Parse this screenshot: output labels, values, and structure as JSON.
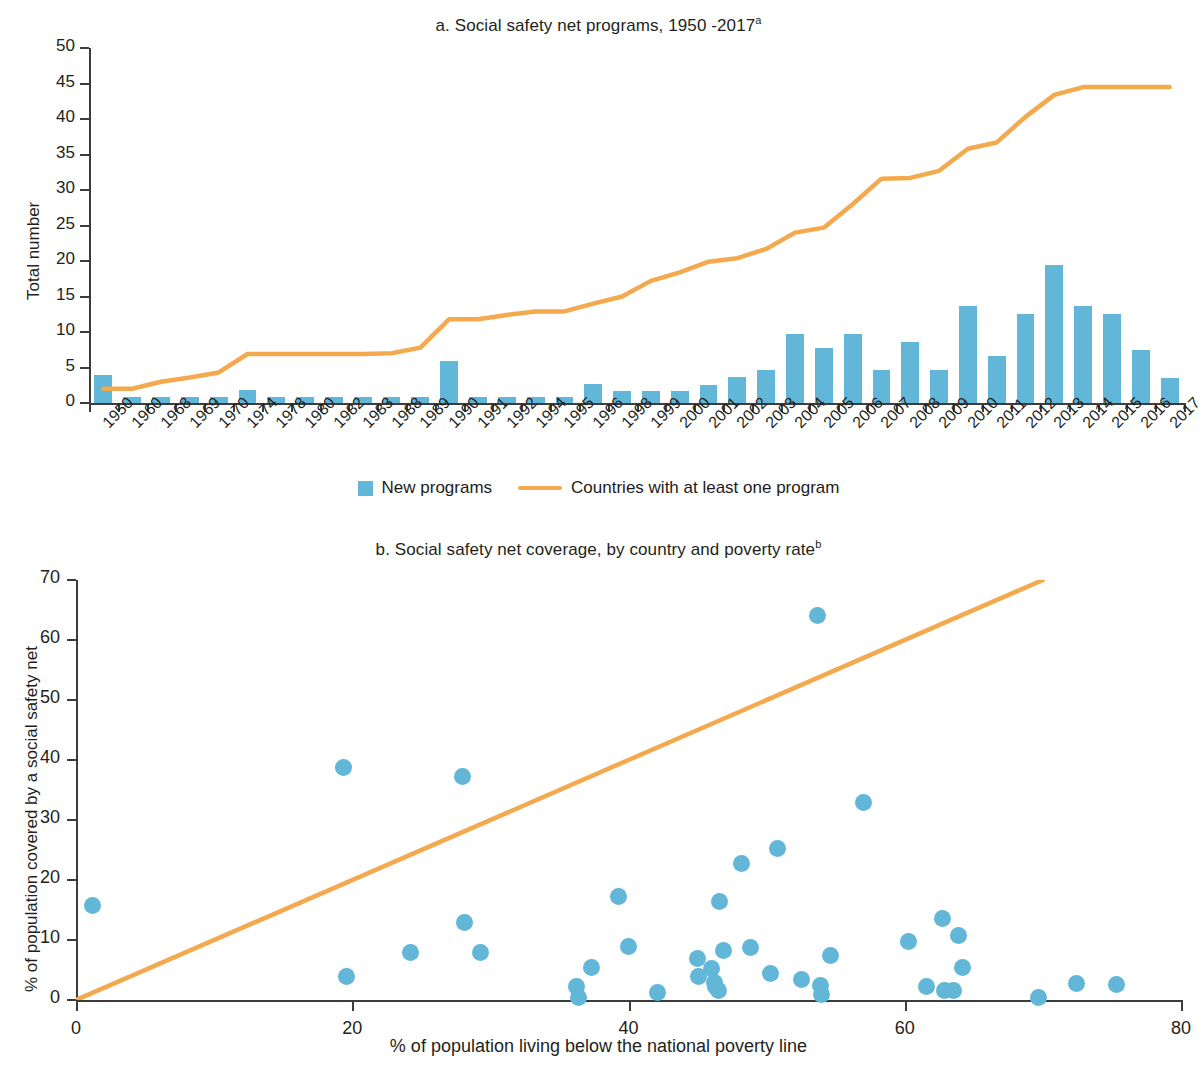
{
  "colors": {
    "bar": "#62b7d8",
    "line": "#f5a94e",
    "axis": "#3c3c3c",
    "text": "#231f20"
  },
  "panel_a": {
    "title": "a. Social safety net programs, 1950 -2017",
    "title_superscript": "a",
    "y_axis_label": "Total number",
    "y_ticks": [
      "0",
      "5",
      "10",
      "15",
      "20",
      "25",
      "30",
      "35",
      "40",
      "45",
      "50"
    ],
    "legend": [
      {
        "label": "New programs",
        "marker": "square-swatch"
      },
      {
        "label": "Countries with at least one program",
        "marker": "line-swatch"
      }
    ]
  },
  "panel_b": {
    "title": "b. Social safety net coverage, by country and poverty rate",
    "title_superscript": "b",
    "y_axis_label": "% of population covered by a social safety net",
    "x_axis_label": "% of population living below the national poverty line",
    "y_ticks": [
      "0",
      "10",
      "20",
      "30",
      "40",
      "50",
      "60",
      "70"
    ],
    "x_ticks": [
      "0",
      "20",
      "40",
      "60",
      "80"
    ]
  },
  "chart_data": [
    {
      "type": "bar",
      "id": "panel-a",
      "title": "a. Social safety net programs, 1950 -2017",
      "xlabel": "",
      "ylabel": "Total number",
      "ylim": [
        0,
        50
      ],
      "ytick_step": 5,
      "grid": false,
      "legend_position": "bottom",
      "categories": [
        "1950",
        "1960",
        "1968",
        "1969",
        "1970",
        "1974",
        "1978",
        "1980",
        "1982",
        "1983",
        "1988",
        "1989",
        "1990",
        "1991",
        "1992",
        "1994",
        "1995",
        "1996",
        "1998",
        "1999",
        "2000",
        "2001",
        "2002",
        "2003",
        "2004",
        "2005",
        "2006",
        "2007",
        "2008",
        "2009",
        "2010",
        "2011",
        "2012",
        "2013",
        "2014",
        "2015",
        "2016",
        "2017"
      ],
      "series": [
        {
          "name": "New programs",
          "kind": "bar",
          "color": "#62b7d8",
          "values": [
            4.0,
            0.8,
            0.8,
            0.8,
            0.8,
            1.9,
            0.8,
            0.8,
            0.8,
            0.8,
            0.8,
            0.8,
            5.9,
            0.8,
            0.8,
            0.8,
            0.8,
            2.7,
            1.7,
            1.7,
            1.7,
            2.6,
            3.7,
            4.7,
            9.7,
            7.7,
            9.7,
            4.7,
            8.6,
            4.7,
            13.7,
            6.6,
            12.5,
            19.5,
            13.6,
            12.5,
            7.5,
            3.5
          ]
        },
        {
          "name": "Countries with at least one program",
          "kind": "line",
          "color": "#f5a94e",
          "values": [
            2.0,
            2.0,
            3.0,
            3.6,
            4.3,
            6.9,
            6.9,
            6.9,
            6.9,
            6.9,
            7.0,
            7.8,
            11.8,
            11.8,
            12.4,
            12.9,
            12.9,
            14.0,
            15.0,
            17.2,
            18.4,
            19.9,
            20.4,
            21.7,
            24.0,
            24.7,
            28.0,
            31.6,
            31.7,
            32.7,
            35.8,
            36.7,
            40.3,
            43.4,
            44.5,
            44.5,
            44.5,
            44.5
          ]
        }
      ]
    },
    {
      "type": "scatter",
      "id": "panel-b",
      "title": "b. Social safety net coverage, by country and poverty rate",
      "xlabel": "% of population living below the national poverty line",
      "ylabel": "% of population covered by a social safety net",
      "xlim": [
        0,
        80
      ],
      "ylim": [
        0,
        70
      ],
      "xtick_step": 20,
      "ytick_step": 10,
      "grid": false,
      "legend_position": "none",
      "points": [
        {
          "x": 1.2,
          "y": 15.8
        },
        {
          "x": 19.4,
          "y": 38.8
        },
        {
          "x": 19.6,
          "y": 3.9
        },
        {
          "x": 24.2,
          "y": 7.9
        },
        {
          "x": 28.0,
          "y": 37.3
        },
        {
          "x": 28.1,
          "y": 13.0
        },
        {
          "x": 29.3,
          "y": 8.0
        },
        {
          "x": 36.2,
          "y": 2.3
        },
        {
          "x": 36.4,
          "y": 0.5
        },
        {
          "x": 37.3,
          "y": 5.5
        },
        {
          "x": 39.3,
          "y": 17.3
        },
        {
          "x": 40.0,
          "y": 9.0
        },
        {
          "x": 42.1,
          "y": 1.2
        },
        {
          "x": 45.0,
          "y": 7.0
        },
        {
          "x": 45.1,
          "y": 4.0
        },
        {
          "x": 46.0,
          "y": 5.3
        },
        {
          "x": 46.2,
          "y": 3.0
        },
        {
          "x": 46.3,
          "y": 2.2
        },
        {
          "x": 46.5,
          "y": 1.6
        },
        {
          "x": 46.6,
          "y": 16.5
        },
        {
          "x": 46.9,
          "y": 8.2
        },
        {
          "x": 48.2,
          "y": 22.8
        },
        {
          "x": 48.8,
          "y": 8.8
        },
        {
          "x": 50.3,
          "y": 4.4
        },
        {
          "x": 50.8,
          "y": 25.2
        },
        {
          "x": 52.5,
          "y": 3.5
        },
        {
          "x": 53.7,
          "y": 64.1
        },
        {
          "x": 53.9,
          "y": 2.5
        },
        {
          "x": 54.0,
          "y": 1.0
        },
        {
          "x": 54.6,
          "y": 7.5
        },
        {
          "x": 57.0,
          "y": 33.0
        },
        {
          "x": 60.3,
          "y": 9.8
        },
        {
          "x": 61.6,
          "y": 2.2
        },
        {
          "x": 62.7,
          "y": 13.6
        },
        {
          "x": 62.9,
          "y": 1.6
        },
        {
          "x": 63.5,
          "y": 1.6
        },
        {
          "x": 63.9,
          "y": 10.7
        },
        {
          "x": 64.2,
          "y": 5.4
        },
        {
          "x": 69.7,
          "y": 0.4
        },
        {
          "x": 72.4,
          "y": 2.7
        },
        {
          "x": 75.3,
          "y": 2.6
        }
      ],
      "trend_line": {
        "name": "45-degree reference line",
        "color": "#f5a94e",
        "x0": 0,
        "y0": 0,
        "x1": 70,
        "y1": 70
      }
    }
  ]
}
